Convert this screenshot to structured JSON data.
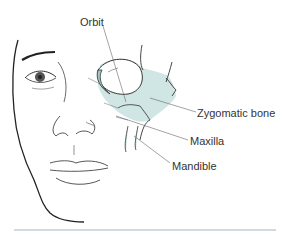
{
  "figure": {
    "labels": {
      "orbit": "Orbit",
      "zygomatic": "Zygomatic bone",
      "maxilla": "Maxilla",
      "mandible": "Mandible"
    },
    "colors": {
      "bone_fill": "#cfe6e4",
      "bone_shade": "#9fc9c5",
      "line": "#333333",
      "leader": "#666666",
      "rule": "#9fb7c6"
    }
  }
}
